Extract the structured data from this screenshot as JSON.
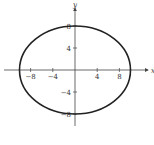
{
  "chart_data": {
    "type": "line",
    "title": "",
    "xlabel": "x",
    "ylabel": "y",
    "curve": "ellipse",
    "equation_implied": "x^2/100 + y^2/64 = 1",
    "center": [
      0,
      0
    ],
    "semi_axes": {
      "a": 10,
      "b": 8
    },
    "x_ticks": [
      -8,
      -4,
      4,
      8
    ],
    "y_ticks": [
      8,
      4,
      -4,
      -8
    ],
    "x_tick_labels": [
      "−8",
      "−4",
      "4",
      "8"
    ],
    "y_tick_labels": [
      "8",
      "4",
      "−4",
      "−8"
    ],
    "xlim": [
      -12.5,
      12.5
    ],
    "ylim": [
      -11,
      11
    ],
    "grid": false,
    "legend": null
  },
  "colors": {
    "curve": "#222222",
    "axes": "#444444"
  }
}
